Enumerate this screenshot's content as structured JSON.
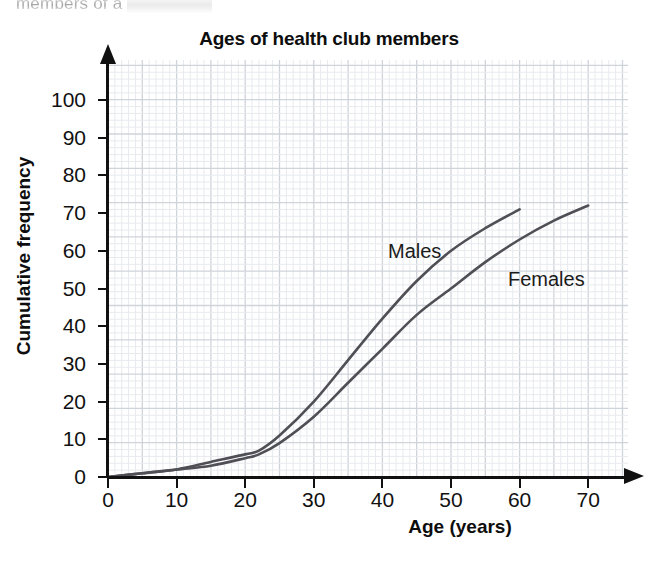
{
  "page": {
    "top_fragment": "members of a health club"
  },
  "chart_data": {
    "type": "line",
    "title": "Ages of health club members",
    "xlabel": "Age (years)",
    "ylabel": "Cumulative frequency",
    "xlim": [
      0,
      72
    ],
    "ylim": [
      0,
      104
    ],
    "xticks": [
      0,
      10,
      20,
      30,
      40,
      50,
      60,
      70
    ],
    "yticks": [
      0,
      10,
      20,
      30,
      40,
      50,
      60,
      70,
      80,
      90,
      100
    ],
    "grid": true,
    "grid_minor_color": "#e8eaee",
    "grid_major_color": "#cfd3da",
    "axis_color": "#111111",
    "legend": "inline-labels",
    "series": [
      {
        "name": "Males",
        "color": "#4f4f55",
        "label_position": {
          "x": 42,
          "y": 64
        },
        "x": [
          0,
          5,
          10,
          15,
          20,
          22,
          25,
          30,
          35,
          40,
          45,
          50,
          55,
          60
        ],
        "values": [
          0,
          1,
          2,
          4,
          6,
          7,
          11,
          20,
          31,
          42,
          52,
          60,
          66,
          71
        ]
      },
      {
        "name": "Females",
        "color": "#4f4f55",
        "label_position": {
          "x": 58,
          "y": 57
        },
        "x": [
          0,
          5,
          10,
          15,
          20,
          22,
          25,
          30,
          35,
          40,
          45,
          50,
          55,
          60,
          65,
          70
        ],
        "values": [
          0,
          1,
          2,
          3,
          5,
          6,
          9,
          16,
          25,
          34,
          43,
          50,
          57,
          63,
          68,
          72
        ]
      }
    ]
  }
}
